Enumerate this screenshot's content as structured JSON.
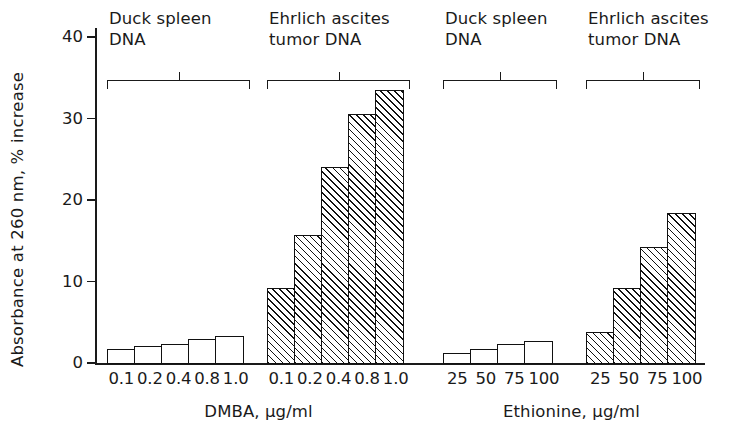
{
  "chart_data": {
    "type": "bar",
    "title": "",
    "xlabel": "",
    "ylabel": "Absorbance at 260 nm, % increase",
    "ylim": [
      0,
      42
    ],
    "yticks": [
      0,
      10,
      20,
      30,
      40
    ],
    "ytick_labels": [
      "0",
      "10",
      "20",
      "30",
      "40"
    ],
    "grid": false,
    "legend": null,
    "panels": [
      {
        "axis_title": "DMBA, µg/ml",
        "groups": [
          {
            "label": "Duck spleen\nDNA",
            "fill": "open",
            "categories": [
              "0.1",
              "0.2",
              "0.4",
              "0.8",
              "1.0"
            ],
            "values": [
              1.7,
              2.0,
              2.3,
              2.9,
              3.2
            ]
          },
          {
            "label": "Ehrlich ascites\ntumor DNA",
            "fill": "hatched",
            "categories": [
              "0.1",
              "0.2",
              "0.4",
              "0.8",
              "1.0"
            ],
            "values": [
              9.2,
              15.6,
              24.0,
              30.5,
              33.4
            ]
          }
        ]
      },
      {
        "axis_title": "Ethionine, µg/ml",
        "groups": [
          {
            "label": "Duck spleen\nDNA",
            "fill": "open",
            "categories": [
              "25",
              "50",
              "75",
              "100"
            ],
            "values": [
              1.2,
              1.6,
              2.3,
              2.6
            ]
          },
          {
            "label": "Ehrlich ascites\ntumor DNA",
            "fill": "hatched",
            "categories": [
              "25",
              "50",
              "75",
              "100"
            ],
            "values": [
              3.7,
              9.1,
              14.2,
              18.3
            ]
          }
        ]
      }
    ]
  }
}
